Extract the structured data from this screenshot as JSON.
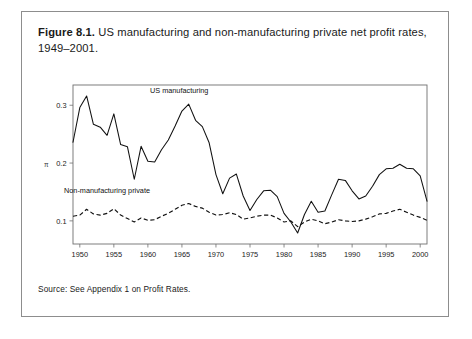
{
  "figure": {
    "label": "Figure 8.1.",
    "caption": "US manufacturing and non-manufacturing private net profit rates, 1949–2001.",
    "source_note": "Source: See Appendix 1 on Profit Rates."
  },
  "chart_data": {
    "type": "line",
    "title": "US manufacturing and non-manufacturing private net profit rates, 1949–2001",
    "xlabel": "",
    "ylabel": "π",
    "xlim": [
      1949,
      2001
    ],
    "ylim": [
      0.06,
      0.335
    ],
    "grid": false,
    "legend_position": "inline-annotation",
    "xticks": [
      1950,
      1955,
      1960,
      1965,
      1970,
      1975,
      1980,
      1985,
      1990,
      1995,
      2000
    ],
    "xticklabels": [
      "1950",
      "1955",
      "1960",
      "1965",
      "1970",
      "1975",
      "1980",
      "1985",
      "1990",
      "1995",
      "2000"
    ],
    "yticks": [
      0.1,
      0.2,
      0.3
    ],
    "yticklabels": [
      "0.1",
      "0.2",
      "0.3"
    ],
    "x": [
      1949,
      1950,
      1951,
      1952,
      1953,
      1954,
      1955,
      1956,
      1957,
      1958,
      1959,
      1960,
      1961,
      1962,
      1963,
      1964,
      1965,
      1966,
      1967,
      1968,
      1969,
      1970,
      1971,
      1972,
      1973,
      1974,
      1975,
      1976,
      1977,
      1978,
      1979,
      1980,
      1981,
      1982,
      1983,
      1984,
      1985,
      1986,
      1987,
      1988,
      1989,
      1990,
      1991,
      1992,
      1993,
      1994,
      1995,
      1996,
      1997,
      1998,
      1999,
      2000,
      2001
    ],
    "series": [
      {
        "name": "US manufacturing",
        "style": "solid",
        "color": "#111111",
        "values": [
          0.236,
          0.296,
          0.316,
          0.267,
          0.262,
          0.248,
          0.285,
          0.232,
          0.228,
          0.172,
          0.229,
          0.203,
          0.202,
          0.223,
          0.24,
          0.264,
          0.29,
          0.302,
          0.274,
          0.263,
          0.235,
          0.18,
          0.147,
          0.174,
          0.181,
          0.143,
          0.118,
          0.137,
          0.152,
          0.153,
          0.142,
          0.113,
          0.098,
          0.079,
          0.111,
          0.134,
          0.115,
          0.117,
          0.145,
          0.172,
          0.17,
          0.152,
          0.138,
          0.143,
          0.16,
          0.18,
          0.19,
          0.191,
          0.198,
          0.191,
          0.19,
          0.178,
          0.134
        ]
      },
      {
        "name": "Non-manufacturing private",
        "style": "dashed",
        "color": "#111111",
        "values": [
          0.108,
          0.11,
          0.12,
          0.112,
          0.11,
          0.113,
          0.121,
          0.11,
          0.104,
          0.098,
          0.105,
          0.101,
          0.102,
          0.108,
          0.113,
          0.12,
          0.127,
          0.13,
          0.125,
          0.122,
          0.115,
          0.11,
          0.111,
          0.114,
          0.111,
          0.103,
          0.105,
          0.108,
          0.11,
          0.11,
          0.105,
          0.098,
          0.1,
          0.09,
          0.098,
          0.103,
          0.1,
          0.095,
          0.098,
          0.102,
          0.1,
          0.099,
          0.1,
          0.103,
          0.107,
          0.112,
          0.113,
          0.117,
          0.12,
          0.115,
          0.11,
          0.106,
          0.101
        ]
      }
    ],
    "annotations": [
      {
        "text": "US manufacturing",
        "x": 1964.6,
        "y": 0.322
      },
      {
        "text": "Non-manufacturing private",
        "x": 1954.0,
        "y": 0.148
      }
    ]
  }
}
